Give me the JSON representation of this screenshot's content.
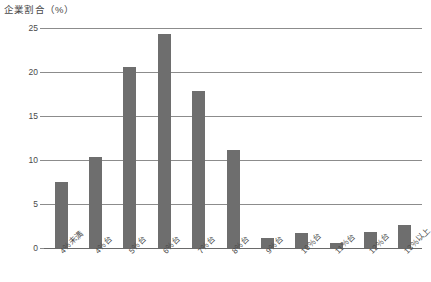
{
  "chart_data": {
    "type": "bar",
    "title": "企業割合（%）",
    "xlabel": "",
    "ylabel": "",
    "categories": [
      "4％未満",
      "4％台",
      "5％台",
      "6％台",
      "7％台",
      "8％台",
      "9％台",
      "10％台",
      "11％台",
      "12％台",
      "13％以上"
    ],
    "values": [
      7.5,
      10.3,
      20.6,
      24.3,
      17.8,
      11.1,
      1.1,
      1.7,
      0.6,
      1.8,
      2.6
    ],
    "ylim": [
      0,
      25
    ],
    "yticks": [
      0,
      5,
      10,
      15,
      20,
      25
    ],
    "ytick_labels": [
      "0",
      "5",
      "10",
      "15",
      "20",
      "25"
    ],
    "grid": true,
    "legend": false,
    "bar_color": "#6e6e6e",
    "grid_color": "#8c8c8c",
    "axis_color": "#6a6a6a",
    "text_color": "#4a4a4a",
    "background": "#ffffff"
  }
}
